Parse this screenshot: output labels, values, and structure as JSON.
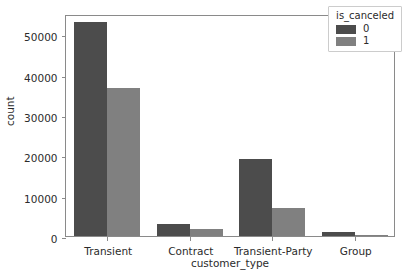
{
  "chart_data": {
    "type": "bar",
    "title": "",
    "xlabel": "customer_type",
    "ylabel": "count",
    "categories": [
      "Transient",
      "Contract",
      "Transient-Party",
      "Group"
    ],
    "series": [
      {
        "name": "0",
        "color": "#4c4c4c",
        "values": [
          53000,
          3100,
          19200,
          1000
        ]
      },
      {
        "name": "1",
        "color": "#808080",
        "values": [
          36600,
          1700,
          7000,
          150
        ]
      }
    ],
    "legend": {
      "title": "is_canceled",
      "position": "upper right",
      "entries": [
        {
          "label": "0",
          "color": "#4c4c4c"
        },
        {
          "label": "1",
          "color": "#808080"
        }
      ]
    },
    "yticks": [
      0,
      10000,
      20000,
      30000,
      40000,
      50000
    ],
    "ytick_labels": [
      "0",
      "10000",
      "20000",
      "30000",
      "40000",
      "50000"
    ],
    "ylim": [
      0,
      55000
    ],
    "xlim": [
      -0.5,
      3.5
    ],
    "grid": false
  }
}
